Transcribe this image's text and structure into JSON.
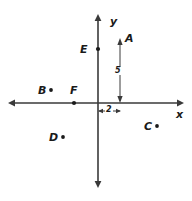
{
  "figure": {
    "background_color": "#ffffff",
    "ink_color": "#3a3a3a",
    "text_color": "#1a1a1a"
  },
  "axes": {
    "x_label": "x",
    "y_label": "y",
    "origin_px": {
      "x": 98,
      "y": 103
    },
    "x_axis_px": {
      "x1": 8,
      "y1": 103,
      "x2": 184,
      "y2": 103
    },
    "y_axis_px": {
      "x1": 98,
      "y1": 14,
      "x2": 98,
      "y2": 188
    },
    "arrowheads": [
      "left",
      "right",
      "up",
      "down"
    ]
  },
  "points": [
    {
      "id": "A",
      "label": "A",
      "label_px": {
        "x": 125,
        "y": 33
      },
      "dot_px": {
        "x": 120,
        "y": 41
      },
      "marker": "arrow-tip",
      "on_axis": false
    },
    {
      "id": "B",
      "label": "B",
      "label_px": {
        "x": 38,
        "y": 85
      },
      "dot_px": {
        "x": 51,
        "y": 90
      },
      "marker": "dot",
      "on_axis": false
    },
    {
      "id": "C",
      "label": "C",
      "label_px": {
        "x": 144,
        "y": 121
      },
      "dot_px": {
        "x": 157,
        "y": 126
      },
      "marker": "dot",
      "on_axis": false
    },
    {
      "id": "D",
      "label": "D",
      "label_px": {
        "x": 49,
        "y": 132
      },
      "dot_px": {
        "x": 63,
        "y": 137
      },
      "marker": "dot",
      "on_axis": false
    },
    {
      "id": "E",
      "label": "E",
      "label_px": {
        "x": 80,
        "y": 44
      },
      "dot_px": {
        "x": 98,
        "y": 49
      },
      "marker": "dot",
      "on_axis": true
    },
    {
      "id": "F",
      "label": "F",
      "label_px": {
        "x": 70,
        "y": 85
      },
      "dot_px": {
        "x": 74,
        "y": 103
      },
      "marker": "dot",
      "on_axis": true
    }
  ],
  "dimensions": [
    {
      "id": "vertical-5",
      "value": "5",
      "orientation": "vertical",
      "label_px": {
        "x": 114,
        "y": 67
      },
      "line_px": {
        "x1": 120,
        "y1": 41,
        "x2": 120,
        "y2": 103
      },
      "arrowheads": [
        "up",
        "down"
      ]
    },
    {
      "id": "horizontal-2",
      "value": "2",
      "orientation": "horizontal",
      "label_px": {
        "x": 105,
        "y": 106
      },
      "line_px": {
        "x1": 98,
        "y1": 111,
        "x2": 120,
        "y2": 111
      },
      "arrowheads": [
        "left",
        "right"
      ]
    }
  ]
}
